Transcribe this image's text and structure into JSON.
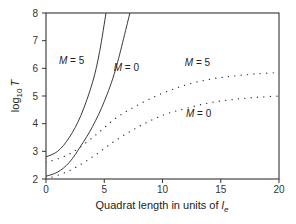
{
  "chart_data": {
    "type": "line",
    "title": "",
    "xlabel": "Quadrat length in units of l_e",
    "xlabel_main": "Quadrat length in units of ",
    "xlabel_var": "l",
    "xlabel_sub": "e",
    "ylabel": "log10 T",
    "ylabel_main": "log",
    "ylabel_sub": "10",
    "ylabel_var": "T",
    "xlim": [
      0,
      20
    ],
    "ylim": [
      2,
      8
    ],
    "xticks": [
      0,
      5,
      10,
      15,
      20
    ],
    "yticks": [
      2,
      3,
      4,
      5,
      6,
      7,
      8
    ],
    "grid": false,
    "legend": "none (inline annotations)",
    "series": [
      {
        "name": "M = 5 (solid)",
        "style": "solid",
        "x": [
          0,
          1,
          2,
          3,
          4,
          4.6,
          5.15
        ],
        "values": [
          2.8,
          3.0,
          3.5,
          4.3,
          5.5,
          6.6,
          8.0
        ]
      },
      {
        "name": "M = 0 (solid)",
        "style": "solid",
        "x": [
          0,
          1,
          2,
          3,
          4,
          5,
          6,
          7.2
        ],
        "values": [
          2.1,
          2.25,
          2.6,
          3.2,
          3.9,
          4.8,
          6.0,
          8.0
        ]
      },
      {
        "name": "M = 5 (dotted)",
        "style": "dotted",
        "x": [
          0,
          2,
          4,
          6,
          8,
          10,
          12,
          14,
          16,
          18,
          20
        ],
        "values": [
          2.6,
          2.9,
          3.5,
          4.2,
          4.7,
          5.1,
          5.4,
          5.6,
          5.72,
          5.8,
          5.85
        ]
      },
      {
        "name": "M = 0 (dotted)",
        "style": "dotted",
        "x": [
          0,
          2,
          4,
          6,
          8,
          10,
          12,
          14,
          16,
          18,
          20
        ],
        "values": [
          2.0,
          2.3,
          2.8,
          3.4,
          3.9,
          4.3,
          4.55,
          4.75,
          4.87,
          4.95,
          5.0
        ]
      }
    ],
    "annotations": [
      {
        "text": "M = 5",
        "x": 2.2,
        "y": 6.15,
        "target": "solid M=5"
      },
      {
        "text": "M = 0",
        "x": 6.9,
        "y": 5.9,
        "target": "solid M=0"
      },
      {
        "text": "M = 5",
        "x": 13.0,
        "y": 6.1,
        "target": "dotted M=5"
      },
      {
        "text": "M = 0",
        "x": 13.1,
        "y": 4.25,
        "target": "dotted M=0"
      }
    ]
  }
}
